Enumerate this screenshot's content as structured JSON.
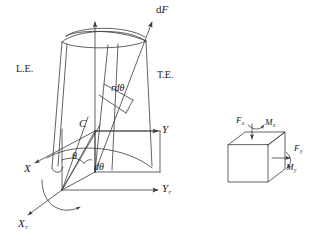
{
  "figure": {
    "type": "engineering-diagram",
    "background_color": "#ffffff",
    "line_color": "#3a3a3a",
    "text_color": "#1a1a1a"
  },
  "blade": {
    "leading_edge_label": "L.E.",
    "trailing_edge_label": "T.E.",
    "center_label": "C",
    "force_label_prefix": "d",
    "force_label_symbol": "F",
    "arc_length_label_prefix": "r",
    "arc_length_label_symbol": "dθ"
  },
  "angles": {
    "theta": "θ",
    "dtheta": "dθ"
  },
  "axes": [
    {
      "name": "x-axis",
      "symbol": "X",
      "subscript": ""
    },
    {
      "name": "y-axis",
      "symbol": "Y",
      "subscript": ""
    },
    {
      "name": "x-rotating-axis",
      "symbol": "X",
      "subscript": "r"
    },
    {
      "name": "y-rotating-axis",
      "symbol": "Y",
      "subscript": "r"
    }
  ],
  "element_cube": {
    "forces": [
      {
        "name": "force-z",
        "symbol": "F",
        "subscript": "z"
      },
      {
        "name": "force-y",
        "symbol": "F",
        "subscript": "y"
      }
    ],
    "moments": [
      {
        "name": "moment-z",
        "symbol": "M",
        "subscript": "z"
      },
      {
        "name": "moment-y",
        "symbol": "M",
        "subscript": "y"
      }
    ]
  }
}
